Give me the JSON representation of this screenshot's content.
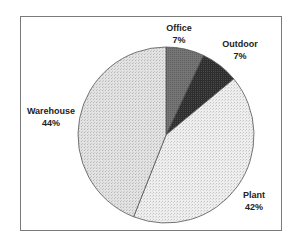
{
  "chart_data": {
    "type": "pie",
    "title": "",
    "categories": [
      "Office",
      "Outdoor",
      "Plant",
      "Warehouse"
    ],
    "values": [
      7,
      7,
      42,
      44
    ],
    "unit": "%",
    "start_angle_deg": 0,
    "direction": "clockwise",
    "legend": "none (data labels on slices)",
    "colors": {
      "Office": "#6e6e6e",
      "Outdoor": "#2a2a2a",
      "Plant": "#ebebeb",
      "Warehouse": "#dcdcdc"
    }
  },
  "labels": {
    "office": {
      "name": "Office",
      "pct": "7%"
    },
    "outdoor": {
      "name": "Outdoor",
      "pct": "7%"
    },
    "plant": {
      "name": "Plant",
      "pct": "42%"
    },
    "warehouse": {
      "name": "Warehouse",
      "pct": "44%"
    }
  }
}
